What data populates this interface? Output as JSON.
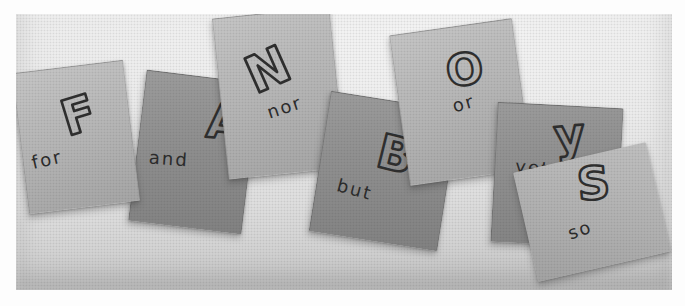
{
  "figure": {
    "type": "black-and-white photograph",
    "sequence": "FANBOYS"
  },
  "notes": [
    {
      "letter": "F",
      "word": "for",
      "tone": "light"
    },
    {
      "letter": "A",
      "word": "and",
      "tone": "dark"
    },
    {
      "letter": "N",
      "word": "nor",
      "tone": "light"
    },
    {
      "letter": "B",
      "word": "but",
      "tone": "dark"
    },
    {
      "letter": "O",
      "word": "or",
      "tone": "light"
    },
    {
      "letter": "y",
      "word": "yet",
      "tone": "dark"
    },
    {
      "letter": "S",
      "word": "so",
      "tone": "light"
    }
  ],
  "colors": {
    "margin": "#ffffff",
    "photo_background": "#e7e7e7",
    "light_note": "#b4b4b4",
    "dark_note": "#8d8d8d",
    "ink": "#2e2e2e"
  }
}
